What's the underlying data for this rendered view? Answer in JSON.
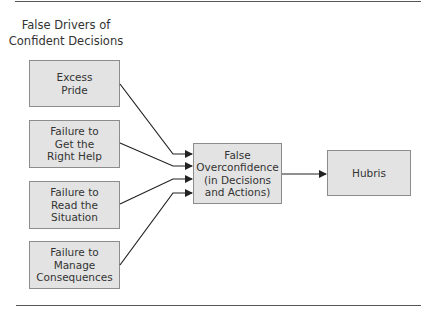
{
  "title": "False Drivers of\nConfident Decisions",
  "drivers": [
    {
      "label": "Excess\nPride"
    },
    {
      "label": "Failure to\nGet the\nRight Help"
    },
    {
      "label": "Failure to\nRead the\nSituation"
    },
    {
      "label": "Failure to\nManage\nConsequences"
    }
  ],
  "center": {
    "label": "False\nOverconfidence\n(in Decisions\nand Actions)"
  },
  "result": {
    "label": "Hubris"
  },
  "colors": {
    "box_fill": "#e3e3e3",
    "box_border": "#8c8c8c",
    "line": "#222222"
  }
}
